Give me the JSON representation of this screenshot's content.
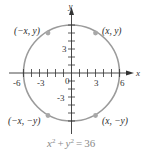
{
  "figure": {
    "type": "circle-on-coordinate-plane",
    "colors": {
      "circle": "#9b9b9b",
      "axes": "#333333",
      "points": "#a8a8a8",
      "equation": "#8a8a8a"
    },
    "axes": {
      "x_label": "x",
      "y_label": "y",
      "origin_label": "0",
      "x_tick_labels": [
        "-6",
        "-3",
        "3",
        "6"
      ],
      "y_tick_labels": [
        "3",
        "-3"
      ]
    },
    "points": [
      {
        "label": "(−x, y)",
        "quadrant": "II"
      },
      {
        "label": "(x, y)",
        "quadrant": "I"
      },
      {
        "label": "(−x, −y)",
        "quadrant": "III"
      },
      {
        "label": "(x, −y)",
        "quadrant": "IV"
      }
    ],
    "equation": {
      "lhs_x": "x",
      "lhs_x_exp": "2",
      "plus": "+",
      "lhs_y": "y",
      "lhs_y_exp": "2",
      "equals": "=",
      "rhs": "36"
    },
    "radius": 6
  }
}
